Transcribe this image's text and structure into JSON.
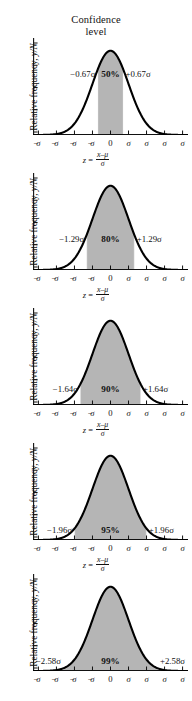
{
  "figure": {
    "title_line1": "Confidence",
    "title_line2": "level",
    "ylabel_prefix": "Relative frequency, ",
    "ylabel_italic": "y/N",
    "formula_z": "z",
    "formula_eq": " = ",
    "formula_numerator": "x–μ",
    "formula_denominator": "σ",
    "background_color": "#ffffff",
    "curve_color": "#000000",
    "shade_color": "#b5b5b5",
    "axis_color": "#111111"
  },
  "axis": {
    "xticks": [
      "−4σ",
      "−3σ",
      "−2σ",
      "−1σ",
      "0",
      "1σ",
      "2σ",
      "3σ",
      "4σ"
    ],
    "xtick_values": [
      -4,
      -3,
      -2,
      -1,
      0,
      1,
      2,
      3,
      4
    ],
    "yticks_count": 5
  },
  "chart_data": {
    "type": "area",
    "title": "Confidence level",
    "xlabel": "z = (x−μ)/σ",
    "ylabel": "Relative frequency, y/N",
    "xlim": [
      -4.3,
      4.3
    ],
    "ylim": [
      0,
      1.08
    ],
    "grid": false,
    "legend": null,
    "curve": "standard normal distribution",
    "xticks": [
      -4,
      -3,
      -2,
      -1,
      0,
      1,
      2,
      3,
      4
    ],
    "xticklabels": [
      "−4σ",
      "−3σ",
      "−2σ",
      "−1σ",
      "0",
      "1σ",
      "2σ",
      "3σ",
      "4σ"
    ],
    "panels": [
      {
        "confidence": "50%",
        "z": 0.67,
        "left_label": "−0.67σ",
        "right_label": "+0.67σ",
        "center_label": "50%",
        "shade_from": -0.67,
        "shade_to": 0.67
      },
      {
        "confidence": "80%",
        "z": 1.29,
        "left_label": "−1.29σ",
        "right_label": "+1.29σ",
        "center_label": "80%",
        "shade_from": -1.29,
        "shade_to": 1.29
      },
      {
        "confidence": "90%",
        "z": 1.64,
        "left_label": "−1.64σ",
        "right_label": "+1.64σ",
        "center_label": "90%",
        "shade_from": -1.64,
        "shade_to": 1.64
      },
      {
        "confidence": "95%",
        "z": 1.96,
        "left_label": "−1.96σ",
        "right_label": "+1.96σ",
        "center_label": "95%",
        "shade_from": -1.96,
        "shade_to": 1.96
      },
      {
        "confidence": "99%",
        "z": 2.58,
        "left_label": "−2.58σ",
        "right_label": "+2.58σ",
        "center_label": "99%",
        "shade_from": -2.58,
        "shade_to": 2.58
      }
    ]
  }
}
